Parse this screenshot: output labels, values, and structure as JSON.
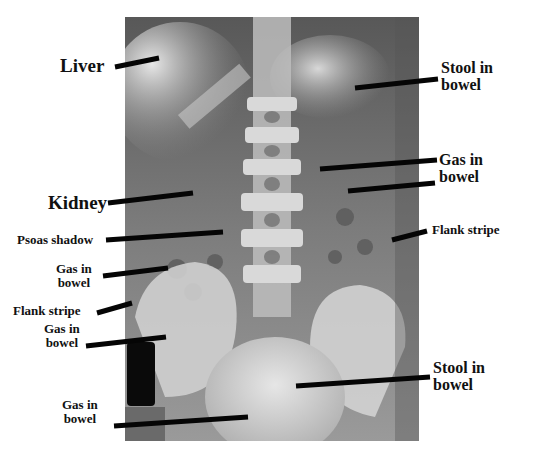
{
  "figure": {
    "labels": [
      {
        "id": "liver",
        "text": "Liver"
      },
      {
        "id": "kidney",
        "text": "Kidney"
      },
      {
        "id": "psoas-shadow",
        "text": "Psoas shadow"
      },
      {
        "id": "gas-left-1",
        "line1": "Gas in",
        "line2": "bowel"
      },
      {
        "id": "flank-stripe-left",
        "text": "Flank stripe"
      },
      {
        "id": "gas-left-2",
        "line1": "Gas in",
        "line2": "bowel"
      },
      {
        "id": "gas-bottom",
        "line1": "Gas in",
        "line2": "bowel"
      },
      {
        "id": "stool-top",
        "line1": "Stool in",
        "line2": "bowel"
      },
      {
        "id": "gas-right",
        "line1": "Gas in",
        "line2": "bowel"
      },
      {
        "id": "flank-stripe-right",
        "text": "Flank stripe"
      },
      {
        "id": "stool-bottom",
        "line1": "Stool in",
        "line2": "bowel"
      }
    ]
  }
}
